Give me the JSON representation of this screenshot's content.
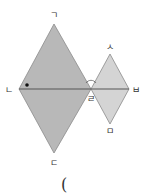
{
  "diagram": {
    "colors": {
      "large_rhombus_fill": "#b8b8b8",
      "small_rhombus_fill": "#d4d4d4",
      "stroke": "#8a8a8a",
      "line": "#555555",
      "text": "#333333"
    },
    "large_rhombus": {
      "vertices": {
        "top": {
          "label": "ㄱ",
          "x": 54,
          "y": 24
        },
        "left": {
          "label": "ㄴ",
          "x": 19,
          "y": 89
        },
        "bottom": {
          "label": "ㄷ",
          "x": 54,
          "y": 153
        },
        "right": {
          "label": "ㄹ",
          "x": 91,
          "y": 89
        }
      }
    },
    "small_rhombus": {
      "vertices": {
        "top": {
          "label": "ㅅ",
          "x": 110,
          "y": 54
        },
        "left": {
          "label": "ㄹ",
          "x": 91,
          "y": 89
        },
        "bottom": {
          "label": "ㅁ",
          "x": 110,
          "y": 124
        },
        "right": {
          "label": "ㅂ",
          "x": 129,
          "y": 89
        }
      }
    },
    "labels": {
      "g": "ㄱ",
      "n": "ㄴ",
      "d": "ㄷ",
      "r": "ㄹ",
      "b": "ㅂ",
      "s": "ㅅ",
      "m": "ㅁ"
    },
    "angle_marks": {
      "dot_at": "ㄴ",
      "arc_at": "ㄹ"
    },
    "answer_blank": "("
  }
}
